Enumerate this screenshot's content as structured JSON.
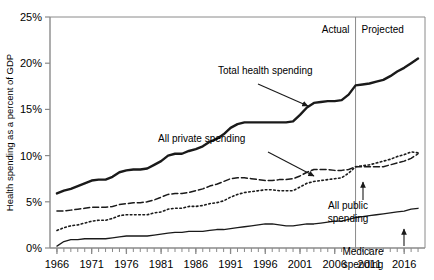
{
  "chart_data": {
    "type": "line",
    "title": "",
    "xlabel": "",
    "ylabel": "Health spending as a percent of GDP",
    "xlim": [
      1965,
      2019
    ],
    "ylim": [
      0,
      25
    ],
    "ytick_values": [
      0,
      5,
      10,
      15,
      20,
      25
    ],
    "ytick_labels": [
      "0%",
      "5%",
      "10%",
      "15%",
      "20%",
      "25%"
    ],
    "xtick_labels": [
      "1966",
      "1971",
      "1976",
      "1981",
      "1986",
      "1991",
      "1996",
      "2001",
      "2006",
      "2011",
      "2016"
    ],
    "xtick_values": [
      1966,
      1971,
      1976,
      1981,
      1986,
      1991,
      1996,
      2001,
      2006,
      2011,
      2016
    ],
    "minor_xticks_every": 1,
    "grid": false,
    "legend": "none (in-plot annotations with arrows)",
    "divider": {
      "value": 2009,
      "label_left": "Actual",
      "label_right": "Projected"
    },
    "x": [
      1966,
      1967,
      1968,
      1969,
      1970,
      1971,
      1972,
      1973,
      1974,
      1975,
      1976,
      1977,
      1978,
      1979,
      1980,
      1981,
      1982,
      1983,
      1984,
      1985,
      1986,
      1987,
      1988,
      1989,
      1990,
      1991,
      1992,
      1993,
      1994,
      1995,
      1996,
      1997,
      1998,
      1999,
      2000,
      2001,
      2002,
      2003,
      2004,
      2005,
      2006,
      2007,
      2008,
      2009,
      2010,
      2011,
      2012,
      2013,
      2014,
      2015,
      2016,
      2017,
      2018
    ],
    "series": [
      {
        "name": "Total health spending",
        "style": "solid-thick",
        "values": [
          5.9,
          6.2,
          6.4,
          6.7,
          7.0,
          7.3,
          7.4,
          7.4,
          7.7,
          8.2,
          8.4,
          8.5,
          8.5,
          8.6,
          9.0,
          9.4,
          10.0,
          10.2,
          10.2,
          10.5,
          10.7,
          11.0,
          11.5,
          11.8,
          12.3,
          13.0,
          13.4,
          13.6,
          13.6,
          13.6,
          13.6,
          13.6,
          13.6,
          13.6,
          13.7,
          14.4,
          15.2,
          15.7,
          15.8,
          15.9,
          15.9,
          16.0,
          16.6,
          17.6,
          17.7,
          17.8,
          18.0,
          18.2,
          18.6,
          19.1,
          19.5,
          20.0,
          20.5
        ]
      },
      {
        "name": "All private spending",
        "style": "dashed",
        "values": [
          4.0,
          4.0,
          4.1,
          4.2,
          4.3,
          4.4,
          4.4,
          4.4,
          4.5,
          4.7,
          4.8,
          4.9,
          4.9,
          5.0,
          5.2,
          5.5,
          5.8,
          5.9,
          5.9,
          6.0,
          6.2,
          6.4,
          6.7,
          6.9,
          7.2,
          7.5,
          7.6,
          7.6,
          7.5,
          7.4,
          7.3,
          7.3,
          7.4,
          7.4,
          7.5,
          7.8,
          8.2,
          8.5,
          8.5,
          8.5,
          8.4,
          8.4,
          8.5,
          8.8,
          8.8,
          8.8,
          8.8,
          8.8,
          9.0,
          9.2,
          9.4,
          9.7,
          10.2
        ]
      },
      {
        "name": "All public spending",
        "style": "dotted",
        "values": [
          1.9,
          2.2,
          2.4,
          2.5,
          2.7,
          2.9,
          3.0,
          3.0,
          3.2,
          3.5,
          3.6,
          3.6,
          3.6,
          3.6,
          3.8,
          3.9,
          4.2,
          4.3,
          4.3,
          4.5,
          4.5,
          4.6,
          4.8,
          4.9,
          5.1,
          5.5,
          5.8,
          6.0,
          6.1,
          6.2,
          6.3,
          6.3,
          6.2,
          6.2,
          6.2,
          6.6,
          7.0,
          7.2,
          7.3,
          7.4,
          7.5,
          7.6,
          8.1,
          8.8,
          8.9,
          9.0,
          9.2,
          9.4,
          9.6,
          9.9,
          10.1,
          10.4,
          10.3
        ]
      },
      {
        "name": "Medicare spending",
        "style": "solid-thin",
        "values": [
          0.2,
          0.7,
          0.9,
          0.9,
          1.0,
          1.0,
          1.0,
          1.0,
          1.1,
          1.2,
          1.3,
          1.3,
          1.3,
          1.3,
          1.4,
          1.5,
          1.6,
          1.7,
          1.7,
          1.8,
          1.8,
          1.8,
          1.9,
          2.0,
          2.0,
          2.1,
          2.2,
          2.3,
          2.4,
          2.5,
          2.6,
          2.6,
          2.5,
          2.4,
          2.4,
          2.5,
          2.6,
          2.6,
          2.7,
          2.8,
          2.9,
          2.9,
          3.1,
          3.3,
          3.4,
          3.5,
          3.6,
          3.7,
          3.8,
          3.9,
          4.0,
          4.2,
          4.3
        ]
      }
    ],
    "annotations": [
      {
        "name": "total-health-spending",
        "text": "Total health spending",
        "text_x": 218,
        "text_y": 74,
        "arrow_from": [
          258,
          84
        ],
        "arrow_to": [
          308,
          106
        ]
      },
      {
        "name": "all-private-spending",
        "text": "All private spending",
        "text_x": 158,
        "text_y": 142,
        "arrow_from": [
          268,
          152
        ],
        "arrow_to": [
          314,
          176
        ]
      },
      {
        "name": "all-public-spending",
        "text": "All public spending",
        "line1": "All public",
        "line2": "spending",
        "text_x": 348,
        "text_y": 209,
        "arrow_from": [
          363,
          200
        ],
        "arrow_to": [
          363,
          182
        ]
      },
      {
        "name": "medicare-spending",
        "text": "Medicare spending",
        "line1": "Medicare",
        "line2": "spending",
        "text_x": 363,
        "text_y": 255,
        "arrow_from": [
          404,
          246
        ],
        "arrow_to": [
          404,
          229
        ]
      }
    ]
  },
  "colors": {
    "line": "#1a1a1a",
    "axis": "#8a8a8a",
    "frame": "#8a8a8a",
    "text": "#000000",
    "background": "#ffffff"
  }
}
